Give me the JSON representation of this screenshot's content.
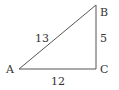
{
  "diagram": {
    "type": "right-triangle",
    "vertices": {
      "A": {
        "label": "A",
        "x": 19,
        "y": 69
      },
      "B": {
        "label": "B",
        "x": 96,
        "y": 5
      },
      "C": {
        "label": "C",
        "x": 96,
        "y": 69
      }
    },
    "sides": {
      "AB": {
        "label": "13"
      },
      "BC": {
        "label": "5"
      },
      "AC": {
        "label": "12"
      }
    },
    "right_angle_at": "C",
    "colors": {
      "line": "#555555",
      "text": "#333333",
      "background": "#ffffff"
    }
  }
}
